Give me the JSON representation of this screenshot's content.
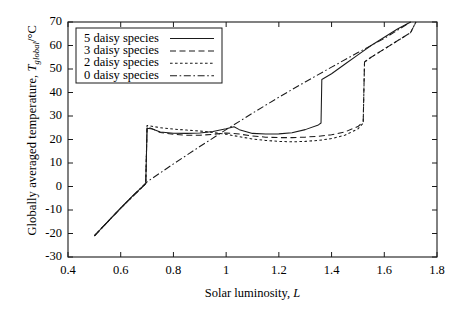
{
  "chart_data": {
    "type": "line",
    "title": "",
    "xlabel": "Solar luminosity, L",
    "ylabel_prefix": "Globally averaged temperature, ",
    "ylabel_symbol": "T",
    "ylabel_sub": "global",
    "ylabel_suffix": "/°C",
    "xlim": [
      0.4,
      1.8
    ],
    "ylim": [
      -30,
      70
    ],
    "xticks": [
      "0.4",
      "0.6",
      "0.8",
      "1",
      "1.2",
      "1.4",
      "1.6",
      "1.8"
    ],
    "xtick_values": [
      0.4,
      0.6,
      0.8,
      1.0,
      1.2,
      1.4,
      1.6,
      1.8
    ],
    "yticks": [
      "70",
      "60",
      "50",
      "40",
      "30",
      "20",
      "10",
      "0",
      "-10",
      "-20",
      "-30"
    ],
    "ytick_values": [
      70,
      60,
      50,
      40,
      30,
      20,
      10,
      0,
      -10,
      -20,
      -30
    ],
    "grid": false,
    "legend_position": "upper-left",
    "legend_entries": [
      {
        "label": "5 daisy species",
        "style": "solid"
      },
      {
        "label": "3 daisy species",
        "style": "dashed"
      },
      {
        "label": "2 daisy species",
        "style": "dotted"
      },
      {
        "label": "0 daisy species",
        "style": "dashdot"
      }
    ],
    "series": [
      {
        "name": "5 daisy species",
        "style": "solid",
        "points": [
          [
            0.5,
            -21.0
          ],
          [
            0.55,
            -15.0
          ],
          [
            0.6,
            -9.2
          ],
          [
            0.65,
            -3.5
          ],
          [
            0.695,
            1.2
          ],
          [
            0.7,
            24.8
          ],
          [
            0.72,
            24.5
          ],
          [
            0.75,
            23.2
          ],
          [
            0.8,
            22.7
          ],
          [
            0.85,
            22.6
          ],
          [
            0.9,
            22.8
          ],
          [
            0.95,
            23.4
          ],
          [
            1.0,
            24.6
          ],
          [
            1.03,
            25.4
          ],
          [
            1.05,
            24.2
          ],
          [
            1.1,
            22.6
          ],
          [
            1.15,
            22.3
          ],
          [
            1.2,
            22.4
          ],
          [
            1.25,
            22.9
          ],
          [
            1.3,
            24.2
          ],
          [
            1.35,
            26.2
          ],
          [
            1.36,
            27.0
          ],
          [
            1.363,
            45.5
          ],
          [
            1.4,
            48.0
          ],
          [
            1.45,
            52.0
          ],
          [
            1.5,
            56.0
          ],
          [
            1.55,
            60.0
          ],
          [
            1.6,
            63.5
          ],
          [
            1.65,
            67.0
          ],
          [
            1.7,
            70.0
          ]
        ]
      },
      {
        "name": "3 daisy species",
        "style": "dashed",
        "points": [
          [
            0.5,
            -21.0
          ],
          [
            0.6,
            -9.2
          ],
          [
            0.695,
            1.2
          ],
          [
            0.7,
            25.5
          ],
          [
            0.75,
            23.0
          ],
          [
            0.8,
            22.2
          ],
          [
            0.85,
            21.8
          ],
          [
            0.9,
            21.8
          ],
          [
            0.95,
            22.2
          ],
          [
            1.0,
            22.8
          ],
          [
            1.05,
            22.3
          ],
          [
            1.1,
            21.5
          ],
          [
            1.15,
            21.0
          ],
          [
            1.2,
            20.8
          ],
          [
            1.25,
            20.8
          ],
          [
            1.3,
            21.0
          ],
          [
            1.35,
            21.4
          ],
          [
            1.4,
            22.0
          ],
          [
            1.45,
            23.2
          ],
          [
            1.5,
            25.5
          ],
          [
            1.52,
            27.5
          ],
          [
            1.525,
            53.0
          ],
          [
            1.55,
            55.0
          ],
          [
            1.6,
            58.5
          ],
          [
            1.65,
            62.0
          ],
          [
            1.7,
            65.5
          ],
          [
            1.72,
            70.0
          ]
        ]
      },
      {
        "name": "2 daisy species",
        "style": "dotted",
        "points": [
          [
            0.5,
            -21.0
          ],
          [
            0.6,
            -9.2
          ],
          [
            0.695,
            1.2
          ],
          [
            0.7,
            26.0
          ],
          [
            0.75,
            25.0
          ],
          [
            0.8,
            24.4
          ],
          [
            0.85,
            24.0
          ],
          [
            0.9,
            23.6
          ],
          [
            0.95,
            23.0
          ],
          [
            1.0,
            22.2
          ],
          [
            1.05,
            21.2
          ],
          [
            1.1,
            20.2
          ],
          [
            1.15,
            19.6
          ],
          [
            1.2,
            19.2
          ],
          [
            1.25,
            19.0
          ],
          [
            1.3,
            19.2
          ],
          [
            1.35,
            19.6
          ],
          [
            1.4,
            20.4
          ],
          [
            1.45,
            21.8
          ],
          [
            1.5,
            24.5
          ],
          [
            1.52,
            27.0
          ],
          [
            1.525,
            53.0
          ],
          [
            1.55,
            55.0
          ],
          [
            1.6,
            58.5
          ],
          [
            1.65,
            62.0
          ],
          [
            1.7,
            65.5
          ],
          [
            1.72,
            70.0
          ]
        ]
      },
      {
        "name": "0 daisy species",
        "style": "dashdot",
        "points": [
          [
            0.5,
            -21.0
          ],
          [
            0.6,
            -9.2
          ],
          [
            0.7,
            2.0
          ],
          [
            0.8,
            9.6
          ],
          [
            0.9,
            17.0
          ],
          [
            1.0,
            24.2
          ],
          [
            1.1,
            31.2
          ],
          [
            1.2,
            38.0
          ],
          [
            1.3,
            44.5
          ],
          [
            1.4,
            50.8
          ],
          [
            1.5,
            57.0
          ],
          [
            1.6,
            63.0
          ],
          [
            1.7,
            70.0
          ]
        ]
      }
    ]
  },
  "axis_color": "#1a1a1a",
  "line_color": "#1a1a1a"
}
